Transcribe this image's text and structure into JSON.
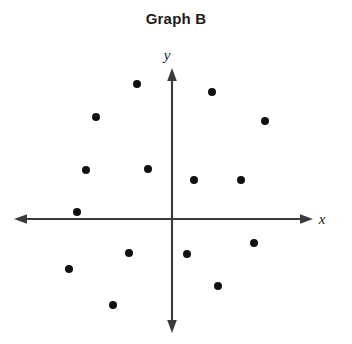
{
  "chart_data": {
    "type": "scatter",
    "title": "Graph B",
    "xlabel": "x",
    "ylabel": "y",
    "grid": false,
    "legend": null,
    "axes_style": "cartesian-arrows-both-ends",
    "origin_px": {
      "x": 172,
      "y": 219
    },
    "units_per_pixel": 20,
    "xlim": [
      -8,
      8
    ],
    "ylim": [
      -6,
      8
    ],
    "axis_extent_px": {
      "x_left": 14,
      "x_right": 313,
      "y_top": 68,
      "y_bottom": 333
    },
    "point_count": 14,
    "marker": {
      "shape": "circle",
      "color": "#111111",
      "radius_px": 4.0
    },
    "points_px": [
      {
        "x": 137,
        "y": 84
      },
      {
        "x": 212,
        "y": 92
      },
      {
        "x": 96,
        "y": 117
      },
      {
        "x": 265,
        "y": 121
      },
      {
        "x": 86,
        "y": 170
      },
      {
        "x": 148,
        "y": 169
      },
      {
        "x": 194,
        "y": 180
      },
      {
        "x": 241,
        "y": 180
      },
      {
        "x": 77,
        "y": 212
      },
      {
        "x": 254,
        "y": 243
      },
      {
        "x": 129,
        "y": 253
      },
      {
        "x": 187,
        "y": 254
      },
      {
        "x": 69,
        "y": 269
      },
      {
        "x": 218,
        "y": 286
      },
      {
        "x": 113,
        "y": 305
      }
    ],
    "points": [
      {
        "x": -1.75,
        "y": 6.75
      },
      {
        "x": 2.0,
        "y": 6.35
      },
      {
        "x": -3.8,
        "y": 5.1
      },
      {
        "x": 4.65,
        "y": 4.9
      },
      {
        "x": -4.3,
        "y": 2.45
      },
      {
        "x": -1.2,
        "y": 2.5
      },
      {
        "x": 1.1,
        "y": 1.95
      },
      {
        "x": 3.45,
        "y": 1.95
      },
      {
        "x": -4.75,
        "y": 0.35
      },
      {
        "x": 4.1,
        "y": -1.2
      },
      {
        "x": -2.15,
        "y": -1.7
      },
      {
        "x": 0.75,
        "y": -1.75
      },
      {
        "x": -5.15,
        "y": -2.5
      },
      {
        "x": 2.3,
        "y": -3.35
      },
      {
        "x": -2.95,
        "y": -4.3
      }
    ]
  },
  "figure": {
    "title": "Graph B",
    "x_axis_label": "x",
    "y_axis_label": "y",
    "background_color": "#ffffff",
    "axis_color": "#3b3b3b",
    "point_color": "#111111"
  }
}
